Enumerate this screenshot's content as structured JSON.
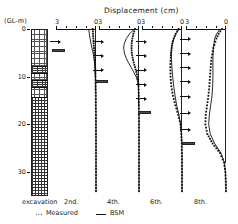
{
  "figure": {
    "title": "Displacement (cm)",
    "y_axis_label": "(GL-m)",
    "y_ticks": [
      "0",
      "10",
      "20",
      "30"
    ],
    "excavation_label": "excavation"
  },
  "legend": {
    "measured_label": "Measured",
    "measured_marker": "dotted-square-series",
    "bsm_label": "BSM",
    "bsm_marker": "solid-line-series"
  },
  "chart_data": {
    "type": "line",
    "title": "Displacement (cm)",
    "xlabel": "Displacement (cm)",
    "ylabel": "(GL-m)",
    "xlim": [
      3,
      0
    ],
    "ylim": [
      0,
      35
    ],
    "x_ticks": [
      3,
      0
    ],
    "y_ticks": [
      0,
      10,
      20,
      30
    ],
    "grid": false,
    "legend_position": "bottom-left",
    "orientation": "depth-vertical-inverted",
    "panels": [
      {
        "label": "2nd.",
        "x_tick_labels": [
          "3",
          "0"
        ],
        "excavation_stage": 2,
        "strut_depths": [
          4.5
        ],
        "pressure_arrow_depths": [
          2.5
        ],
        "series": [
          {
            "name": "Measured",
            "style": "dotted",
            "depths": [
              0,
              1,
              2,
              3,
              4,
              5,
              6,
              7,
              8,
              9,
              10,
              12,
              14,
              16,
              18,
              20,
              22,
              24,
              26,
              28,
              30,
              32,
              34
            ],
            "values": [
              0.25,
              0.22,
              0.2,
              0.18,
              0.15,
              0.12,
              0.1,
              0.08,
              0.06,
              0.05,
              0.04,
              0.03,
              0.02,
              0.02,
              0.01,
              0.01,
              0.0,
              0.0,
              0.0,
              0.0,
              0.0,
              0.0,
              0.0
            ]
          },
          {
            "name": "BSM",
            "style": "solid",
            "depths": [
              0,
              1,
              2,
              3,
              4,
              5,
              6,
              7,
              8,
              9,
              10,
              12,
              14,
              16,
              18,
              20,
              22,
              24,
              26,
              28,
              30,
              32,
              34
            ],
            "values": [
              0.55,
              0.5,
              0.44,
              0.38,
              0.3,
              0.22,
              0.16,
              0.11,
              0.08,
              0.06,
              0.04,
              0.02,
              0.01,
              0.01,
              0.0,
              0.0,
              0.0,
              0.0,
              0.0,
              0.0,
              0.0,
              0.0,
              0.0
            ]
          }
        ]
      },
      {
        "label": "4th.",
        "x_tick_labels": [
          "3",
          "0"
        ],
        "excavation_stage": 4,
        "strut_depths": [
          11.0
        ],
        "pressure_arrow_depths": [
          2.5,
          5.5,
          8.5
        ],
        "series": [
          {
            "name": "Measured",
            "style": "dotted",
            "depths": [
              0,
              1,
              2,
              3,
              4,
              5,
              6,
              7,
              8,
              9,
              10,
              11,
              12,
              14,
              16,
              18,
              20,
              22,
              24,
              26,
              28,
              30,
              32,
              34
            ],
            "values": [
              0.3,
              0.42,
              0.5,
              0.55,
              0.56,
              0.54,
              0.48,
              0.4,
              0.3,
              0.2,
              0.12,
              0.06,
              0.03,
              0.02,
              0.01,
              0.01,
              0.0,
              0.0,
              0.0,
              0.0,
              0.0,
              0.0,
              0.0,
              0.0
            ]
          },
          {
            "name": "BSM",
            "style": "solid",
            "depths": [
              0,
              1,
              2,
              3,
              4,
              5,
              6,
              7,
              8,
              9,
              10,
              11,
              12,
              14,
              16,
              18,
              20,
              22,
              24,
              26,
              28,
              30,
              32,
              34
            ],
            "values": [
              0.35,
              0.7,
              0.95,
              1.1,
              1.15,
              1.1,
              0.98,
              0.8,
              0.6,
              0.4,
              0.22,
              0.1,
              0.05,
              0.02,
              0.01,
              0.0,
              0.0,
              0.0,
              0.0,
              0.0,
              0.0,
              0.0,
              0.0,
              0.0
            ]
          }
        ]
      },
      {
        "label": "6th.",
        "x_tick_labels": [
          "3",
          "0"
        ],
        "excavation_stage": 6,
        "strut_depths": [
          17.5
        ],
        "pressure_arrow_depths": [
          2.5,
          5.5,
          8.5,
          11.5,
          14.5
        ],
        "series": [
          {
            "name": "Measured",
            "style": "dotted",
            "depths": [
              0,
              1,
              2,
              3,
              4,
              5,
              6,
              8,
              10,
              12,
              14,
              16,
              18,
              20,
              22,
              24,
              26,
              28,
              30,
              32,
              34
            ],
            "values": [
              0.25,
              0.48,
              0.62,
              0.72,
              0.78,
              0.82,
              0.85,
              0.88,
              0.86,
              0.8,
              0.68,
              0.5,
              0.28,
              0.12,
              0.05,
              0.02,
              0.01,
              0.0,
              0.0,
              0.0,
              0.0
            ]
          },
          {
            "name": "BSM",
            "style": "solid",
            "depths": [
              0,
              1,
              2,
              3,
              4,
              5,
              6,
              8,
              10,
              12,
              14,
              16,
              18,
              20,
              22,
              24,
              26,
              28,
              30,
              32,
              34
            ],
            "values": [
              0.2,
              0.45,
              0.62,
              0.72,
              0.78,
              0.8,
              0.8,
              0.76,
              0.7,
              0.62,
              0.52,
              0.4,
              0.24,
              0.1,
              0.04,
              0.02,
              0.0,
              0.0,
              0.0,
              0.0,
              0.0
            ]
          }
        ]
      },
      {
        "label": "8th.",
        "x_tick_labels": [
          "3",
          "0"
        ],
        "excavation_stage": 8,
        "strut_depths": [
          24.0
        ],
        "pressure_arrow_depths": [
          2.0,
          5.0,
          8.0,
          11.0,
          14.0,
          17.5,
          21.0
        ],
        "series": [
          {
            "name": "Measured",
            "style": "dotted",
            "depths": [
              0,
              1,
              2,
              4,
              6,
              8,
              10,
              12,
              14,
              16,
              18,
              20,
              22,
              24,
              26,
              28,
              30,
              32,
              34
            ],
            "values": [
              0.3,
              0.55,
              0.72,
              0.95,
              1.08,
              1.15,
              1.2,
              1.25,
              1.32,
              1.42,
              1.52,
              1.55,
              1.4,
              1.0,
              0.45,
              0.15,
              0.05,
              0.02,
              0.0
            ]
          },
          {
            "name": "BSM",
            "style": "solid",
            "depths": [
              0,
              1,
              2,
              4,
              6,
              8,
              10,
              12,
              14,
              16,
              18,
              20,
              22,
              24,
              26,
              28,
              30,
              32,
              34
            ],
            "values": [
              0.45,
              0.7,
              0.85,
              0.95,
              0.98,
              0.98,
              0.98,
              1.0,
              1.05,
              1.15,
              1.25,
              1.3,
              1.18,
              0.85,
              0.38,
              0.12,
              0.04,
              0.01,
              0.0
            ]
          }
        ]
      }
    ],
    "soil_profile": {
      "label": "excavation",
      "layers": [
        {
          "top_depth": 0.0,
          "bottom_depth": 7.5,
          "pattern": "dots"
        },
        {
          "top_depth": 7.5,
          "bottom_depth": 9.0,
          "pattern": "dark"
        },
        {
          "top_depth": 9.0,
          "bottom_depth": 10.5,
          "pattern": "dots"
        },
        {
          "top_depth": 10.5,
          "bottom_depth": 12.0,
          "pattern": "dark"
        },
        {
          "top_depth": 12.0,
          "bottom_depth": 14.0,
          "pattern": "dots"
        },
        {
          "top_depth": 14.0,
          "bottom_depth": 35.0,
          "pattern": "brick"
        }
      ]
    }
  }
}
